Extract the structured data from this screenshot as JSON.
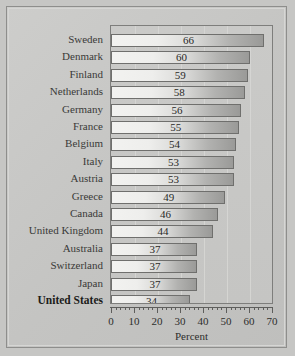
{
  "chart_data": {
    "type": "bar",
    "orientation": "horizontal",
    "title": "",
    "xlabel": "Percent",
    "ylabel": "",
    "xlim": [
      0,
      70
    ],
    "xticks": [
      0,
      10,
      20,
      30,
      40,
      50,
      60,
      70
    ],
    "minor_tick_step": 2,
    "grid": true,
    "grid_axis": "x",
    "legend": "none",
    "value_labels_shown": true,
    "categories": [
      "Sweden",
      "Denmark",
      "Finland",
      "Netherlands",
      "Germany",
      "France",
      "Belgium",
      "Italy",
      "Austria",
      "Greece",
      "Canada",
      "United Kingdom",
      "Australia",
      "Switzerland",
      "Japan",
      "United States"
    ],
    "values": [
      66,
      60,
      59,
      58,
      56,
      55,
      54,
      53,
      53,
      49,
      46,
      44,
      37,
      37,
      37,
      34
    ],
    "highlighted_category": "United States",
    "colors": {
      "page_background": "#c6c6c4",
      "plot_background": "#c8c8c6",
      "bar_light": "#f2f2f0",
      "bar_dark": "#9a9a98",
      "bar_border": "#6f6f6d",
      "gridline": "#d7d7d5",
      "axis": "#5e5e5c",
      "text": "#2e2e2c",
      "frame_border": "#8e8e8c"
    }
  },
  "axis": {
    "tick_labels": [
      "0",
      "10",
      "20",
      "30",
      "40",
      "50",
      "60",
      "70"
    ],
    "title": "Percent"
  }
}
